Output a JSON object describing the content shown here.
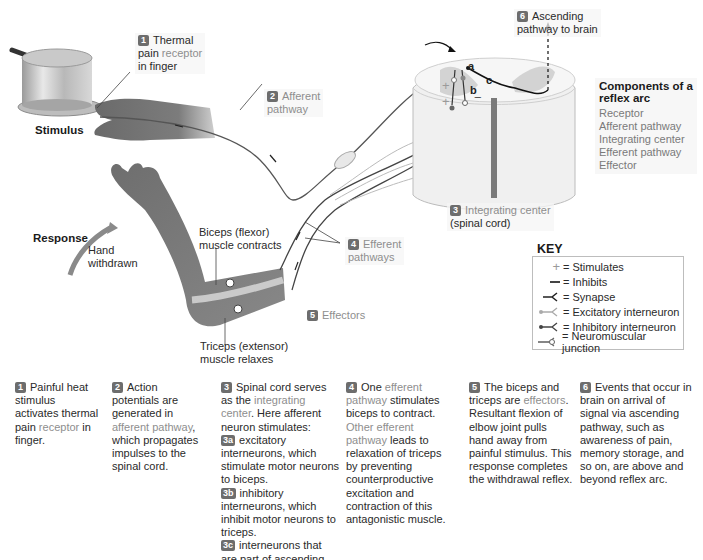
{
  "figure": {
    "colors": {
      "badge": "#6d6d6d",
      "highlight_text": "#8e8e8e",
      "skin": "#7a7a7a",
      "spinal_cord": "#ececec",
      "gray_matter": "#d2d2d2",
      "nerve_line": "#2a2a2a"
    }
  },
  "diagram_labels": {
    "thermal_receptor": {
      "badge": "1",
      "line1": "Thermal",
      "line2_pre": "pain ",
      "line2_hl": "receptor",
      "line3": "in finger"
    },
    "stimulus": "Stimulus",
    "afferent": {
      "badge": "2",
      "line1": "Afferent",
      "line2": "pathway"
    },
    "ascending": {
      "badge": "6",
      "line1": "Ascending",
      "line2": "pathway to brain"
    },
    "integrating": {
      "badge": "3",
      "line1": "Integrating center",
      "line2": "(spinal cord)"
    },
    "efferent": {
      "badge": "4",
      "line1": "Efferent",
      "line2": "pathways"
    },
    "effectors": {
      "badge": "5",
      "text": "Effectors"
    },
    "response": "Response",
    "hand_withdrawn": {
      "line1": "Hand",
      "line2": "withdrawn"
    },
    "biceps": {
      "line1": "Biceps (flexor)",
      "line2": "muscle contracts"
    },
    "triceps": {
      "line1": "Triceps (extensor)",
      "line2": "muscle relaxes"
    },
    "cord_letters": {
      "a": "a",
      "b": "b",
      "c": "c"
    },
    "signs": {
      "plus": "+",
      "minus": "−"
    }
  },
  "components": {
    "title_line1": "Components of a",
    "title_line2": "reflex arc",
    "items": [
      "Receptor",
      "Afferent pathway",
      "Integrating center",
      "Efferent pathway",
      "Effector"
    ]
  },
  "key": {
    "title": "KEY",
    "items": [
      {
        "icon": "plus-icon",
        "label": "= Stimulates"
      },
      {
        "icon": "minus-icon",
        "label": "= Inhibits"
      },
      {
        "icon": "synapse-icon",
        "label": "= Synapse"
      },
      {
        "icon": "excitatory-interneuron-icon",
        "label": "= Excitatory interneuron"
      },
      {
        "icon": "inhibitory-interneuron-icon",
        "label": "= Inhibitory interneuron"
      },
      {
        "icon": "neuromuscular-junction-icon",
        "label": "= Neuromuscular junction"
      }
    ]
  },
  "steps": [
    {
      "badge": "1",
      "parts": [
        {
          "t": "Painful heat stimulus activates thermal pain ",
          "hl": false
        },
        {
          "t": "receptor",
          "hl": true
        },
        {
          "t": " in finger.",
          "hl": false
        }
      ]
    },
    {
      "badge": "2",
      "parts": [
        {
          "t": "Action potentials are generated in ",
          "hl": false
        },
        {
          "t": "afferent pathway",
          "hl": true
        },
        {
          "t": ", which propagates impulses to the spinal cord.",
          "hl": false
        }
      ]
    },
    {
      "badge": "3",
      "parts": [
        {
          "t": "Spinal cord serves as the ",
          "hl": false
        },
        {
          "t": "integrating center",
          "hl": true
        },
        {
          "t": ". Here afferent neuron stimulates:",
          "hl": false
        }
      ],
      "sub": [
        {
          "badge": "3a",
          "text": "excitatory interneurons, which stimulate motor neurons to biceps."
        },
        {
          "badge": "3b",
          "text": "inhibitory interneurons, which inhibit motor neurons to triceps."
        },
        {
          "badge": "3c",
          "text": "interneurons that are part of ascending pathway to brain."
        }
      ]
    },
    {
      "badge": "4",
      "parts": [
        {
          "t": "One ",
          "hl": false
        },
        {
          "t": "efferent pathway",
          "hl": true
        },
        {
          "t": " stimulates biceps to contract. ",
          "hl": false
        },
        {
          "t": "Other efferent pathway",
          "hl": true
        },
        {
          "t": " leads to relaxation of triceps by preventing counterproductive excitation and contraction of this antagonistic muscle.",
          "hl": false
        }
      ]
    },
    {
      "badge": "5",
      "parts": [
        {
          "t": "The biceps and triceps are ",
          "hl": false
        },
        {
          "t": "effectors",
          "hl": true
        },
        {
          "t": ". Resultant flexion of elbow joint pulls hand away from painful stimulus. This response completes the withdrawal reflex.",
          "hl": false
        }
      ]
    },
    {
      "badge": "6",
      "parts": [
        {
          "t": "Events that occur in brain on arrival of signal via ascending pathway, such as awareness of pain, memory storage, and so on, are above and beyond reflex arc.",
          "hl": false
        }
      ]
    }
  ]
}
